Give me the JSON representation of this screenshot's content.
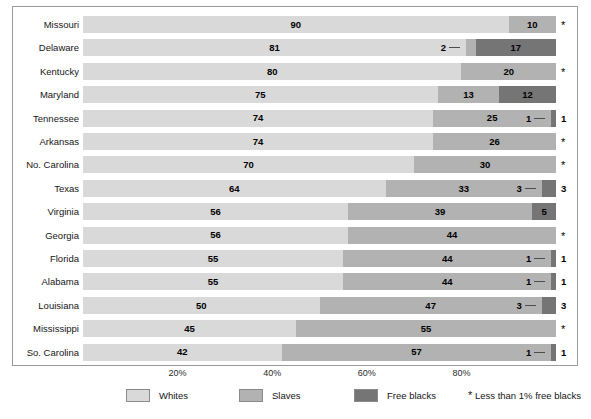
{
  "chart_data": {
    "type": "bar",
    "orientation": "horizontal",
    "stacked": true,
    "title": "",
    "subtitle": "",
    "xlabel": "",
    "ylabel": "",
    "xlim": [
      0,
      100
    ],
    "grid": false,
    "legend_position": "bottom",
    "categories": [
      "Missouri",
      "Delaware",
      "Kentucky",
      "Maryland",
      "Tennessee",
      "Arkansas",
      "No. Carolina",
      "Texas",
      "Virginia",
      "Georgia",
      "Florida",
      "Alabama",
      "Louisiana",
      "Mississippi",
      "So. Carolina"
    ],
    "series": [
      {
        "name": "Whites",
        "color": "#d9d9d9",
        "values": [
          90,
          81,
          80,
          75,
          74,
          74,
          70,
          64,
          56,
          56,
          55,
          55,
          50,
          45,
          42
        ]
      },
      {
        "name": "Slaves",
        "color": "#b2b2b2",
        "values": [
          10,
          2,
          20,
          13,
          25,
          26,
          30,
          33,
          39,
          44,
          44,
          44,
          47,
          55,
          57
        ]
      },
      {
        "name": "Free blacks",
        "color": "#757575",
        "values": [
          0,
          17,
          0,
          12,
          1,
          0,
          0,
          3,
          5,
          0,
          1,
          1,
          3,
          0,
          1
        ]
      }
    ],
    "row_notes": [
      "*",
      "",
      "*",
      "",
      "1",
      "*",
      "*",
      "3",
      "5",
      "*",
      "1",
      "1",
      "3",
      "*",
      "1"
    ],
    "xticks": [
      20,
      40,
      60,
      80
    ],
    "xticklabels": [
      "20%",
      "40%",
      "60%",
      "80%"
    ],
    "annotations": {
      "delaware_slaves_leader": "2"
    }
  },
  "legend": {
    "items": [
      {
        "label": "Whites",
        "color": "#d9d9d9"
      },
      {
        "label": "Slaves",
        "color": "#b2b2b2"
      },
      {
        "label": "Free blacks",
        "color": "#757575"
      }
    ],
    "footnote_symbol": "*",
    "footnote_text": "Less than 1% free blacks"
  }
}
